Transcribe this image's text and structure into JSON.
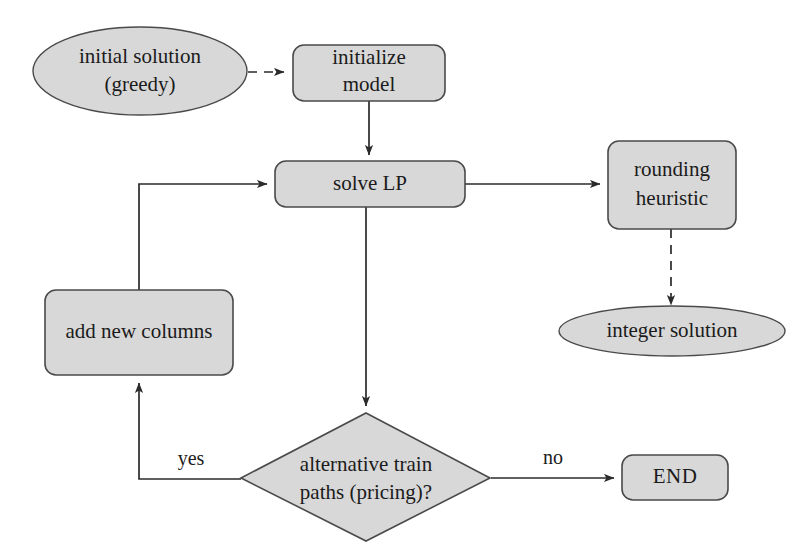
{
  "diagram": {
    "colors": {
      "shape_fill": "#d8d8d8",
      "shape_stroke": "#4a4a4a",
      "connector": "#2b2b2b",
      "text": "#1b1b1b",
      "background": "#ffffff"
    },
    "nodes": {
      "initial_solution": {
        "shape": "ellipse",
        "line1": "initial solution",
        "line2": "(greedy)"
      },
      "initialize_model": {
        "shape": "rounded-rect",
        "line1": "initialize",
        "line2": "model"
      },
      "solve_lp": {
        "shape": "rounded-rect",
        "line1": "solve LP"
      },
      "rounding_heuristic": {
        "shape": "rounded-rect",
        "line1": "rounding",
        "line2": "heuristic"
      },
      "integer_solution": {
        "shape": "ellipse",
        "line1": "integer solution"
      },
      "add_new_columns": {
        "shape": "rounded-rect",
        "line1": "add new columns"
      },
      "decision_pricing": {
        "shape": "diamond",
        "line1": "alternative train",
        "line2": "paths (pricing)?"
      },
      "end": {
        "shape": "rounded-rect",
        "line1": "END"
      }
    },
    "edge_labels": {
      "yes": "yes",
      "no": "no"
    },
    "edges": [
      {
        "from": "initial_solution",
        "to": "initialize_model",
        "style": "dashed",
        "label": ""
      },
      {
        "from": "initialize_model",
        "to": "solve_lp",
        "style": "solid",
        "label": ""
      },
      {
        "from": "solve_lp",
        "to": "rounding_heuristic",
        "style": "solid",
        "label": ""
      },
      {
        "from": "rounding_heuristic",
        "to": "integer_solution",
        "style": "dashed",
        "label": ""
      },
      {
        "from": "solve_lp",
        "to": "decision_pricing",
        "style": "solid",
        "label": ""
      },
      {
        "from": "decision_pricing",
        "to": "add_new_columns",
        "style": "solid",
        "label": "yes"
      },
      {
        "from": "decision_pricing",
        "to": "end",
        "style": "solid",
        "label": "no"
      },
      {
        "from": "add_new_columns",
        "to": "solve_lp",
        "style": "solid",
        "label": ""
      }
    ]
  }
}
